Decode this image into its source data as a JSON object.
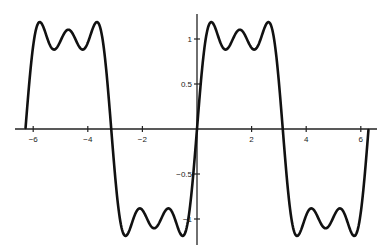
{
  "chart_data": {
    "type": "line",
    "title": "",
    "xlabel": "",
    "ylabel": "",
    "xlim": [
      -6.4,
      6.5
    ],
    "ylim": [
      -1.3,
      1.3
    ],
    "grid": false,
    "legend": null,
    "x_ticks": [
      -6,
      -4,
      -2,
      2,
      4,
      6
    ],
    "x_tick_labels": [
      "−6",
      "−4",
      "−2",
      "2",
      "4",
      "6"
    ],
    "y_ticks": [
      1,
      0.5,
      -0.5,
      -1
    ],
    "y_tick_labels": [
      "1",
      "0.5",
      "−0.5",
      "−1"
    ],
    "series": [
      {
        "name": "(4/π)(sin x + sin 3x/3 + sin 5x/5)",
        "function": "fourier_square_3_terms",
        "x_range": [
          -6.28,
          6.28
        ],
        "sample_points": [
          {
            "x": -6.28,
            "y": 0.0
          },
          {
            "x": -5.76,
            "y": 1.18
          },
          {
            "x": -5.3,
            "y": 0.9
          },
          {
            "x": -4.71,
            "y": 1.07
          },
          {
            "x": -4.13,
            "y": 0.9
          },
          {
            "x": -3.67,
            "y": 1.18
          },
          {
            "x": -3.14,
            "y": 0.0
          },
          {
            "x": -2.62,
            "y": -1.18
          },
          {
            "x": -2.16,
            "y": -0.9
          },
          {
            "x": -1.57,
            "y": -1.07
          },
          {
            "x": -0.98,
            "y": -0.9
          },
          {
            "x": -0.52,
            "y": -1.18
          },
          {
            "x": 0.0,
            "y": 0.0
          },
          {
            "x": 0.52,
            "y": 1.18
          },
          {
            "x": 0.98,
            "y": 0.9
          },
          {
            "x": 1.57,
            "y": 1.07
          },
          {
            "x": 2.16,
            "y": 0.9
          },
          {
            "x": 2.62,
            "y": 1.18
          },
          {
            "x": 3.14,
            "y": 0.0
          },
          {
            "x": 3.67,
            "y": -1.18
          },
          {
            "x": 4.13,
            "y": -0.9
          },
          {
            "x": 4.71,
            "y": -1.07
          },
          {
            "x": 5.3,
            "y": -0.9
          },
          {
            "x": 5.76,
            "y": -1.18
          },
          {
            "x": 6.28,
            "y": 0.0
          }
        ],
        "color": "#111111"
      }
    ]
  },
  "layout": {
    "origin_px": [
      197,
      129
    ],
    "x_unit_px": 27.3,
    "y_unit_px": 90,
    "x_axis_px": [
      15,
      377
    ],
    "y_axis_px": [
      14,
      245
    ],
    "line_color": "#111111",
    "axis_color": "#222222"
  }
}
